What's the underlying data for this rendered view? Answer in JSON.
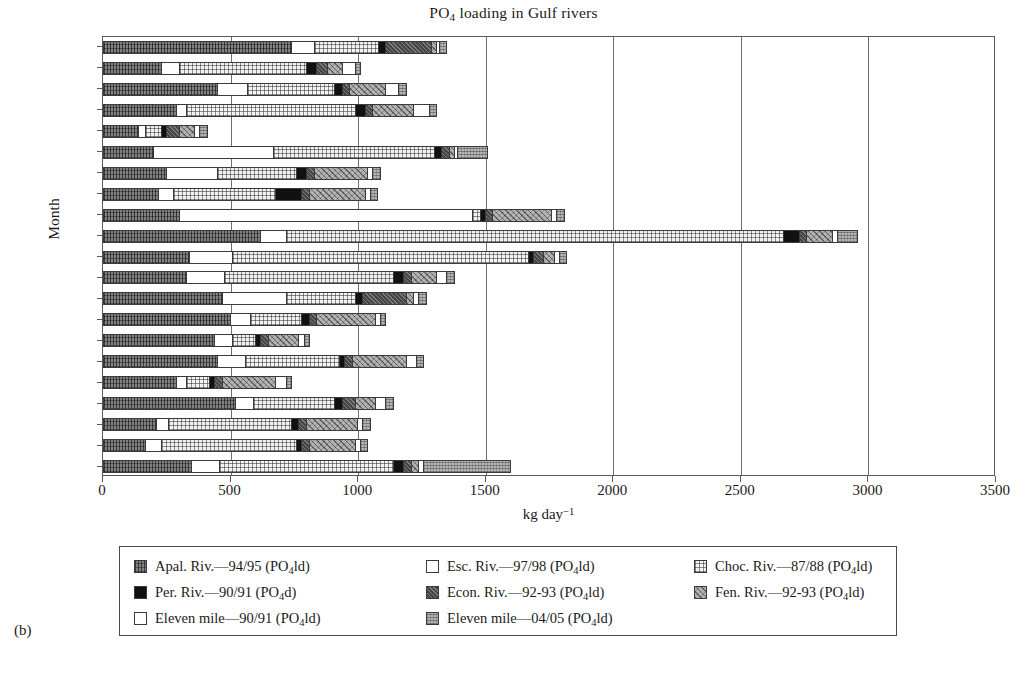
{
  "panel_label": "(b)",
  "chart_data": {
    "type": "bar",
    "orientation": "horizontal",
    "stacked": true,
    "title": "PO4 loading in Gulf rivers",
    "title_parts": {
      "pre": "PO",
      "sub": "4",
      "post": " loading in Gulf rivers"
    },
    "xlabel": "kg day-1",
    "xlabel_parts": {
      "pre": "kg day",
      "sup": "−1"
    },
    "ylabel": "Month",
    "xlim": [
      0,
      3500
    ],
    "xticks": [
      0,
      500,
      1000,
      1500,
      2000,
      2500,
      3000,
      3500
    ],
    "xticklabels": [
      "0",
      "500",
      "1000",
      "1500",
      "2000",
      "2500",
      "3000",
      "3500"
    ],
    "grid": "vertical",
    "legend_position": "below-axes",
    "categories": [
      "Dec",
      "Nov",
      "Oct",
      "Sept",
      "Aug",
      "July",
      "June",
      "May",
      "Apr",
      "Mar",
      "Feb",
      "Jan",
      "Dec",
      "Nov",
      "Oct",
      "Sept",
      "Aug",
      "July",
      "June",
      "May",
      "Apr"
    ],
    "series": [
      {
        "name": "Apal. Riv.—94/95 (PO4ld)",
        "key": "apal",
        "pattern": "gray-vertical-hatch",
        "values": [
          740,
          230,
          450,
          290,
          140,
          200,
          250,
          220,
          300,
          620,
          340,
          330,
          470,
          500,
          440,
          450,
          290,
          520,
          210,
          170,
          350
        ]
      },
      {
        "name": "Esc. Riv.—97/98 (PO4ld)",
        "key": "esc",
        "pattern": "white",
        "values": [
          90,
          70,
          120,
          40,
          30,
          470,
          200,
          60,
          1150,
          100,
          170,
          150,
          250,
          80,
          70,
          110,
          40,
          70,
          50,
          60,
          110
        ]
      },
      {
        "name": "Choc. Riv.—87/88 (PO4ld)",
        "key": "choc",
        "pattern": "light-grid",
        "values": [
          250,
          500,
          340,
          660,
          60,
          630,
          310,
          400,
          30,
          1950,
          1160,
          660,
          270,
          200,
          90,
          370,
          90,
          320,
          480,
          530,
          680
        ]
      },
      {
        "name": "Per. Riv.—90/91 (PO4d)",
        "key": "per",
        "pattern": "solid-black",
        "values": [
          30,
          40,
          30,
          40,
          20,
          30,
          40,
          100,
          20,
          60,
          20,
          40,
          30,
          30,
          20,
          20,
          20,
          30,
          30,
          20,
          40
        ]
      },
      {
        "name": "Econ. Riv.—92-93 (PO4ld)",
        "key": "econ",
        "pattern": "dark-crosshatch",
        "values": [
          180,
          40,
          30,
          30,
          50,
          30,
          30,
          30,
          30,
          30,
          40,
          30,
          170,
          30,
          30,
          30,
          30,
          50,
          30,
          30,
          30
        ]
      },
      {
        "name": "Fen. Riv.—92-93 (PO4ld)",
        "key": "fen",
        "pattern": "medium-diagonal",
        "values": [
          20,
          60,
          140,
          160,
          60,
          20,
          210,
          220,
          230,
          100,
          40,
          100,
          30,
          230,
          120,
          210,
          210,
          80,
          200,
          180,
          30
        ]
      },
      {
        "name": "Eleven mile—90/91 (PO4ld)",
        "key": "eleven9091",
        "pattern": "white",
        "values": [
          10,
          50,
          50,
          60,
          20,
          10,
          20,
          20,
          20,
          20,
          20,
          40,
          20,
          20,
          20,
          40,
          40,
          40,
          20,
          20,
          20
        ]
      },
      {
        "name": "Eleven mile—04/05 (PO4ld)",
        "key": "eleven0405",
        "pattern": "gray-dotted",
        "values": [
          30,
          20,
          30,
          30,
          30,
          120,
          30,
          30,
          30,
          80,
          30,
          30,
          30,
          20,
          20,
          30,
          20,
          30,
          30,
          30,
          340
        ]
      }
    ],
    "totals": [
      1350,
      1010,
      1190,
      1310,
      410,
      1510,
      1090,
      1080,
      1810,
      2960,
      1820,
      1380,
      1270,
      1110,
      810,
      1260,
      740,
      1140,
      1050,
      1040,
      1600
    ]
  },
  "legend": {
    "items": [
      {
        "label_pre": "Apal. Riv.—94/95 (PO",
        "sub": "4",
        "label_post": "ld)",
        "swatch": "apal"
      },
      {
        "label_pre": "Esc. Riv.—97/98 (PO",
        "sub": "4",
        "label_post": "ld)",
        "swatch": "esc"
      },
      {
        "label_pre": "Choc. Riv.—87/88 (PO",
        "sub": "4",
        "label_post": "ld)",
        "swatch": "choc"
      },
      {
        "label_pre": "Per. Riv.—90/91 (PO",
        "sub": "4",
        "label_post": "d)",
        "swatch": "per"
      },
      {
        "label_pre": "Econ. Riv.—92-93 (PO",
        "sub": "4",
        "label_post": "ld)",
        "swatch": "econ"
      },
      {
        "label_pre": "Fen. Riv.—92-93 (PO",
        "sub": "4",
        "label_post": "ld)",
        "swatch": "fen"
      },
      {
        "label_pre": "Eleven mile—90/91 (PO",
        "sub": "4",
        "label_post": "ld)",
        "swatch": "eleven9091"
      },
      {
        "label_pre": "Eleven mile—04/05 (PO",
        "sub": "4",
        "label_post": "ld)",
        "swatch": "eleven0405"
      }
    ],
    "order": [
      0,
      1,
      2,
      3,
      4,
      5,
      6,
      7
    ]
  },
  "colors": {
    "frame": "#5a5a5a",
    "gridline": "#6f6f6f",
    "bar_outline": "#3a3a3a",
    "text": "#1a1a1a",
    "background": "#ffffff"
  }
}
